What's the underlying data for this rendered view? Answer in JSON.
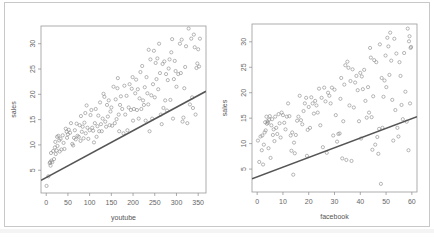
{
  "chart_data": [
    {
      "type": "scatter",
      "title": "",
      "xlabel": "youtube",
      "ylabel": "sales",
      "xlim": [
        -12,
        368
      ],
      "ylim": [
        0.5,
        33.5
      ],
      "x_ticks": [
        0,
        50,
        100,
        150,
        200,
        250,
        300,
        350
      ],
      "y_ticks": [
        5,
        10,
        15,
        20,
        25,
        30
      ],
      "grid": false,
      "legend": null,
      "regression_line": {
        "x0": -12,
        "y0": 3.0,
        "x1": 368,
        "y1": 20.6,
        "color": "#555555"
      },
      "point_style": {
        "shape": "open-circle",
        "color": "#888888"
      },
      "points": [
        [
          0.8,
          1.9
        ],
        [
          5,
          3.8
        ],
        [
          8,
          6.4
        ],
        [
          9,
          6.6
        ],
        [
          10,
          5.9
        ],
        [
          11,
          8.4
        ],
        [
          12,
          6.9
        ],
        [
          14,
          6.6
        ],
        [
          16,
          8.8
        ],
        [
          18,
          7.2
        ],
        [
          20,
          9.5
        ],
        [
          21,
          10.6
        ],
        [
          22,
          8.2
        ],
        [
          24,
          8.9
        ],
        [
          25,
          11.6
        ],
        [
          26,
          9.8
        ],
        [
          28,
          11.8
        ],
        [
          30,
          10.9
        ],
        [
          31,
          8.7
        ],
        [
          33,
          11.2
        ],
        [
          35,
          9.1
        ],
        [
          38,
          11.9
        ],
        [
          40,
          10.4
        ],
        [
          42,
          9.2
        ],
        [
          45,
          13.2
        ],
        [
          47,
          12.6
        ],
        [
          48,
          11.4
        ],
        [
          50,
          12.1
        ],
        [
          52,
          13.0
        ],
        [
          55,
          12.4
        ],
        [
          57,
          14.3
        ],
        [
          60,
          10.2
        ],
        [
          62,
          9.9
        ],
        [
          64,
          11.4
        ],
        [
          66,
          12.9
        ],
        [
          68,
          11.1
        ],
        [
          70,
          14.2
        ],
        [
          72,
          11.8
        ],
        [
          75,
          11.6
        ],
        [
          77,
          13.9
        ],
        [
          79,
          10.8
        ],
        [
          80,
          15.7
        ],
        [
          82,
          12.6
        ],
        [
          84,
          13.6
        ],
        [
          86,
          11.3
        ],
        [
          88,
          14.4
        ],
        [
          90,
          16.3
        ],
        [
          91,
          12.3
        ],
        [
          93,
          17.8
        ],
        [
          95,
          13.4
        ],
        [
          97,
          11.2
        ],
        [
          100,
          12.9
        ],
        [
          102,
          15.9
        ],
        [
          104,
          16.9
        ],
        [
          106,
          13.4
        ],
        [
          108,
          12.8
        ],
        [
          110,
          10.5
        ],
        [
          112,
          14.3
        ],
        [
          114,
          17.1
        ],
        [
          116,
          11.6
        ],
        [
          118,
          13.7
        ],
        [
          120,
          15.8
        ],
        [
          122,
          12.7
        ],
        [
          124,
          18.4
        ],
        [
          126,
          14.1
        ],
        [
          128,
          12.7
        ],
        [
          130,
          15.2
        ],
        [
          132,
          20.1
        ],
        [
          134,
          19.5
        ],
        [
          136,
          14.6
        ],
        [
          138,
          13.6
        ],
        [
          140,
          17.9
        ],
        [
          142,
          15.6
        ],
        [
          144,
          18.8
        ],
        [
          146,
          13.9
        ],
        [
          148,
          16.6
        ],
        [
          150,
          17.4
        ],
        [
          152,
          13.8
        ],
        [
          155,
          21.5
        ],
        [
          158,
          14.3
        ],
        [
          160,
          19.0
        ],
        [
          162,
          15.1
        ],
        [
          164,
          21.2
        ],
        [
          165,
          23.2
        ],
        [
          167,
          16.0
        ],
        [
          168,
          12.7
        ],
        [
          170,
          17.9
        ],
        [
          172,
          19.6
        ],
        [
          175,
          17.1
        ],
        [
          178,
          12.3
        ],
        [
          180,
          21.7
        ],
        [
          182,
          16.0
        ],
        [
          185,
          19.7
        ],
        [
          187,
          12.9
        ],
        [
          190,
          17.4
        ],
        [
          192,
          22.0
        ],
        [
          195,
          16.9
        ],
        [
          197,
          21.1
        ],
        [
          199,
          23.4
        ],
        [
          200,
          14.8
        ],
        [
          202,
          17.1
        ],
        [
          205,
          20.2
        ],
        [
          207,
          22.9
        ],
        [
          209,
          16.9
        ],
        [
          211,
          21.0
        ],
        [
          213,
          15.2
        ],
        [
          215,
          19.2
        ],
        [
          217,
          24.4
        ],
        [
          219,
          17.1
        ],
        [
          221,
          25.6
        ],
        [
          223,
          18.8
        ],
        [
          225,
          17.9
        ],
        [
          227,
          21.4
        ],
        [
          229,
          14.8
        ],
        [
          231,
          23.4
        ],
        [
          233,
          20.2
        ],
        [
          235,
          18.0
        ],
        [
          236,
          28.8
        ],
        [
          238,
          12.7
        ],
        [
          240,
          26.9
        ],
        [
          242,
          19.8
        ],
        [
          244,
          15.2
        ],
        [
          246,
          22.0
        ],
        [
          248,
          28.6
        ],
        [
          250,
          19.4
        ],
        [
          252,
          26.2
        ],
        [
          254,
          23.0
        ],
        [
          256,
          27.1
        ],
        [
          258,
          21.0
        ],
        [
          260,
          30.0
        ],
        [
          262,
          24.2
        ],
        [
          264,
          16.0
        ],
        [
          266,
          14.1
        ],
        [
          268,
          26.0
        ],
        [
          270,
          17.3
        ],
        [
          272,
          26.5
        ],
        [
          274,
          18.8
        ],
        [
          276,
          24.0
        ],
        [
          278,
          16.8
        ],
        [
          280,
          22.8
        ],
        [
          282,
          25.1
        ],
        [
          284,
          26.9
        ],
        [
          286,
          18.9
        ],
        [
          288,
          28.3
        ],
        [
          290,
          30.9
        ],
        [
          292,
          15.2
        ],
        [
          294,
          23.0
        ],
        [
          296,
          26.6
        ],
        [
          298,
          24.6
        ],
        [
          300,
          21.5
        ],
        [
          304,
          24.0
        ],
        [
          308,
          30.0
        ],
        [
          310,
          24.2
        ],
        [
          312,
          30.8
        ],
        [
          314,
          14.6
        ],
        [
          316,
          15.4
        ],
        [
          318,
          21.2
        ],
        [
          320,
          25.4
        ],
        [
          322,
          29.5
        ],
        [
          325,
          14.3
        ],
        [
          328,
          33.0
        ],
        [
          331,
          18.0
        ],
        [
          334,
          31.0
        ],
        [
          336,
          19.4
        ],
        [
          338,
          17.3
        ],
        [
          340,
          31.8
        ],
        [
          342,
          29.3
        ],
        [
          344,
          16.0
        ],
        [
          346,
          25.2
        ],
        [
          348,
          26.1
        ],
        [
          350,
          28.9
        ],
        [
          352,
          25.5
        ],
        [
          354,
          31.0
        ]
      ]
    },
    {
      "type": "scatter",
      "title": "",
      "xlabel": "facebook",
      "ylabel": "sales",
      "xlim": [
        -2,
        62
      ],
      "ylim": [
        0.5,
        33.5
      ],
      "x_ticks": [
        0,
        10,
        20,
        30,
        40,
        50,
        60
      ],
      "y_ticks": [
        5,
        10,
        15,
        20,
        25,
        30
      ],
      "grid": false,
      "legend": null,
      "regression_line": {
        "x0": -2,
        "y0": 3.1,
        "x1": 62,
        "y1": 15.3,
        "color": "#555555"
      },
      "point_style": {
        "shape": "open-circle",
        "color": "#888888"
      },
      "points": [
        [
          0.3,
          10.6
        ],
        [
          0.8,
          6.4
        ],
        [
          1.3,
          11.4
        ],
        [
          1.8,
          8.7
        ],
        [
          2.0,
          11.6
        ],
        [
          2.3,
          5.9
        ],
        [
          2.6,
          9.8
        ],
        [
          2.9,
          12.2
        ],
        [
          3.1,
          14.2
        ],
        [
          3.3,
          12.6
        ],
        [
          3.6,
          15.3
        ],
        [
          3.8,
          13.9
        ],
        [
          4.0,
          14.4
        ],
        [
          4.2,
          14.1
        ],
        [
          4.4,
          9.1
        ],
        [
          4.6,
          14.7
        ],
        [
          4.9,
          15.4
        ],
        [
          5.2,
          7.2
        ],
        [
          5.5,
          13.6
        ],
        [
          5.8,
          14.8
        ],
        [
          6.1,
          11.7
        ],
        [
          6.4,
          12.8
        ],
        [
          6.7,
          10.5
        ],
        [
          7.0,
          15.3
        ],
        [
          7.4,
          13.1
        ],
        [
          7.8,
          11.9
        ],
        [
          8.3,
          15.8
        ],
        [
          8.7,
          14.0
        ],
        [
          9.1,
          11.2
        ],
        [
          9.5,
          16.1
        ],
        [
          10.0,
          15.6
        ],
        [
          10.5,
          14.1
        ],
        [
          11.0,
          12.8
        ],
        [
          11.5,
          15.3
        ],
        [
          12.0,
          17.9
        ],
        [
          12.5,
          15.4
        ],
        [
          13.0,
          11.6
        ],
        [
          13.3,
          8.6
        ],
        [
          13.6,
          12.2
        ],
        [
          14.0,
          3.9
        ],
        [
          14.3,
          10.2
        ],
        [
          14.6,
          8.1
        ],
        [
          15.0,
          11.7
        ],
        [
          15.5,
          14.5
        ],
        [
          16.0,
          15.3
        ],
        [
          16.5,
          19.4
        ],
        [
          17.0,
          14.6
        ],
        [
          17.5,
          13.8
        ],
        [
          18.0,
          16.4
        ],
        [
          18.5,
          17.9
        ],
        [
          19.0,
          19.0
        ],
        [
          19.3,
          7.6
        ],
        [
          19.6,
          12.7
        ],
        [
          20.0,
          17.2
        ],
        [
          20.5,
          13.1
        ],
        [
          21.0,
          19.1
        ],
        [
          21.5,
          17.9
        ],
        [
          22.0,
          15.9
        ],
        [
          22.5,
          18.4
        ],
        [
          23.0,
          17.5
        ],
        [
          23.5,
          16.1
        ],
        [
          24.0,
          20.8
        ],
        [
          24.5,
          13.6
        ],
        [
          25.0,
          19.0
        ],
        [
          25.5,
          9.3
        ],
        [
          26.0,
          21.0
        ],
        [
          26.5,
          18.3
        ],
        [
          27.0,
          8.2
        ],
        [
          27.5,
          20.0
        ],
        [
          28.0,
          19.4
        ],
        [
          28.5,
          17.9
        ],
        [
          29.0,
          21.0
        ],
        [
          29.5,
          11.6
        ],
        [
          30.0,
          20.6
        ],
        [
          30.5,
          15.6
        ],
        [
          31.0,
          10.4
        ],
        [
          31.5,
          11.9
        ],
        [
          32.0,
          12.0
        ],
        [
          32.3,
          18.8
        ],
        [
          32.6,
          22.9
        ],
        [
          33.0,
          7.1
        ],
        [
          33.4,
          14.4
        ],
        [
          33.8,
          21.6
        ],
        [
          34.2,
          25.4
        ],
        [
          34.6,
          6.8
        ],
        [
          35.0,
          26.1
        ],
        [
          35.4,
          24.9
        ],
        [
          35.8,
          17.5
        ],
        [
          36.2,
          22.3
        ],
        [
          36.6,
          6.6
        ],
        [
          37.0,
          24.6
        ],
        [
          37.5,
          17.1
        ],
        [
          38.0,
          22.0
        ],
        [
          38.5,
          23.3
        ],
        [
          39.0,
          20.5
        ],
        [
          39.5,
          14.4
        ],
        [
          40.0,
          23.9
        ],
        [
          40.3,
          11.0
        ],
        [
          40.6,
          23.2
        ],
        [
          41.0,
          20.7
        ],
        [
          41.5,
          24.5
        ],
        [
          42.0,
          18.4
        ],
        [
          42.5,
          15.1
        ],
        [
          43.0,
          21.1
        ],
        [
          43.4,
          16.1
        ],
        [
          43.8,
          28.8
        ],
        [
          44.1,
          26.9
        ],
        [
          44.4,
          15.2
        ],
        [
          44.7,
          8.8
        ],
        [
          45.0,
          19.3
        ],
        [
          45.4,
          26.4
        ],
        [
          45.8,
          9.8
        ],
        [
          46.2,
          26.0
        ],
        [
          46.6,
          11.3
        ],
        [
          47.0,
          8.0
        ],
        [
          47.3,
          12.9
        ],
        [
          47.6,
          29.5
        ],
        [
          48.0,
          2.1
        ],
        [
          48.3,
          22.9
        ],
        [
          48.6,
          13.1
        ],
        [
          49.0,
          19.2
        ],
        [
          49.4,
          22.4
        ],
        [
          49.8,
          27.3
        ],
        [
          50.1,
          21.1
        ],
        [
          50.5,
          30.8
        ],
        [
          50.9,
          29.1
        ],
        [
          51.3,
          23.5
        ],
        [
          51.6,
          31.8
        ],
        [
          52.0,
          26.3
        ],
        [
          52.4,
          18.6
        ],
        [
          52.8,
          10.6
        ],
        [
          53.2,
          30.6
        ],
        [
          53.6,
          16.6
        ],
        [
          54.0,
          27.7
        ],
        [
          54.4,
          13.1
        ],
        [
          54.8,
          11.4
        ],
        [
          55.2,
          26.0
        ],
        [
          55.6,
          23.3
        ],
        [
          56.0,
          17.6
        ],
        [
          56.5,
          14.8
        ],
        [
          57.0,
          27.8
        ],
        [
          57.5,
          20.2
        ],
        [
          58.0,
          14.3
        ],
        [
          58.4,
          32.6
        ],
        [
          58.7,
          8.7
        ],
        [
          58.9,
          30.1
        ],
        [
          59.1,
          31.1
        ],
        [
          59.3,
          17.9
        ],
        [
          59.5,
          28.8
        ],
        [
          59.7,
          29.0
        ]
      ]
    }
  ]
}
